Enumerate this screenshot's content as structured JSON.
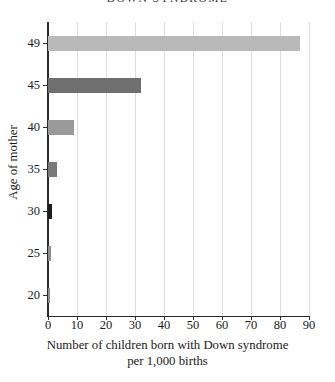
{
  "chart_data": {
    "type": "bar",
    "orientation": "horizontal",
    "title": "DOWN SYNDROME",
    "xlabel_line1": "Number of children born with Down syndrome",
    "xlabel_line2": "per 1,000 births",
    "ylabel": "Age of mother",
    "categories": [
      "20",
      "25",
      "30",
      "35",
      "40",
      "45",
      "49"
    ],
    "values": [
      0.8,
      1.0,
      1.5,
      3.0,
      9.0,
      32.0,
      87.0
    ],
    "bar_colors": [
      "#8e8e8e",
      "#8e8e8e",
      "#1c1c1c",
      "#787878",
      "#9a9a9a",
      "#6f6f6f",
      "#b9b9b9"
    ],
    "xlim": [
      0,
      90
    ],
    "xticks": [
      0,
      10,
      20,
      30,
      40,
      50,
      60,
      70,
      80,
      90
    ],
    "xtick_labels": [
      "0",
      "10",
      "20",
      "30",
      "40",
      "50",
      "60",
      "70",
      "80",
      "90"
    ],
    "ytick_labels": [
      "49",
      "45",
      "40",
      "35",
      "30",
      "25",
      "20"
    ],
    "grid": "vertical",
    "grid_color": "#dedede",
    "legend": "none",
    "axis_color": "#2b2b2b",
    "background": "#ffffff"
  }
}
